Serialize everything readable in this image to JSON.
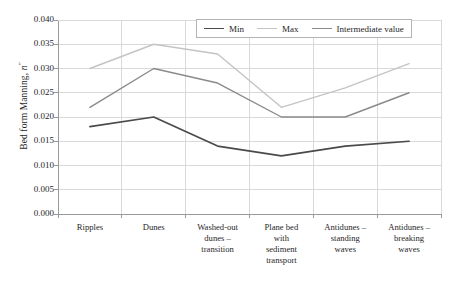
{
  "chart_data": {
    "type": "line",
    "title": "",
    "xlabel": "",
    "ylabel": "Bed form Manning, n″",
    "ylabel_prefix": "Bed form Manning, ",
    "ylabel_symbol": "n",
    "ylabel_superscript": "″",
    "ylim": [
      0.0,
      0.04
    ],
    "ytick_labels": [
      "0.040",
      "0.035",
      "0.030",
      "0.025",
      "0.020",
      "0.015",
      "0.010",
      "0.005",
      "0.000"
    ],
    "ytick_values": [
      0.04,
      0.035,
      0.03,
      0.025,
      0.02,
      0.015,
      0.01,
      0.005,
      0.0
    ],
    "grid": true,
    "grid_axis": "both",
    "legend_position": "top-right-inside",
    "categories": [
      "Ripples",
      "Dunes",
      "Washed-out dunes – transition",
      "Plane bed with sediment transport",
      "Antidunes – standing waves",
      "Antidunes – breaking waves"
    ],
    "category_lines": [
      [
        "Ripples"
      ],
      [
        "Dunes"
      ],
      [
        "Washed-out",
        "dunes –",
        "transition"
      ],
      [
        "Plane bed",
        "with",
        "sediment",
        "transport"
      ],
      [
        "Antidunes –",
        "standing",
        "waves"
      ],
      [
        "Antidunes –",
        "breaking",
        "waves"
      ]
    ],
    "series": [
      {
        "name": "Min",
        "color": "#4a4a4a",
        "values": [
          0.018,
          0.02,
          0.014,
          0.012,
          0.014,
          0.015
        ]
      },
      {
        "name": "Max",
        "color": "#c4c4c4",
        "values": [
          0.03,
          0.035,
          0.033,
          0.022,
          0.026,
          0.031
        ]
      },
      {
        "name": "Intermediate value",
        "color": "#8a8a8a",
        "values": [
          0.022,
          0.03,
          0.027,
          0.02,
          0.02,
          0.025
        ]
      }
    ]
  },
  "legend": {
    "items": [
      {
        "label": "Min",
        "color": "#4a4a4a"
      },
      {
        "label": "Max",
        "color": "#c4c4c4"
      },
      {
        "label": "Intermediate value",
        "color": "#8a8a8a"
      }
    ]
  },
  "colors": {
    "min_series": "#4a4a4a",
    "max_series": "#c4c4c4",
    "intermediate_series": "#8a8a8a",
    "grid": "#d9d9d9",
    "axis": "#9a9a9a",
    "text": "#1f1f1f",
    "background": "#ffffff"
  }
}
